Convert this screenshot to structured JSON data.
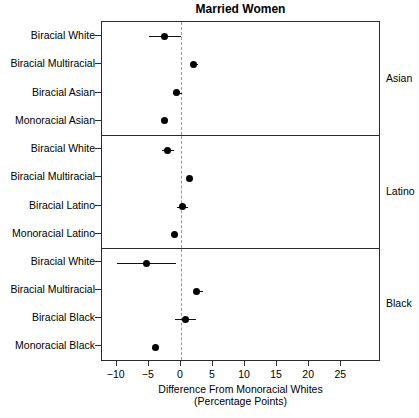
{
  "chart_data": {
    "type": "scatter",
    "title": "Married Women",
    "xlabel": "Difference From Monoracial Whites",
    "xlabel_line2": "(Percentage Points)",
    "ylabel": "",
    "xlim": [
      -12.3,
      31.2
    ],
    "xticks": [
      -10,
      -5,
      0,
      5,
      10,
      15,
      20,
      25
    ],
    "xtick_labels": [
      "−10",
      "−5",
      "0",
      "5",
      "10",
      "15",
      "20",
      "25"
    ],
    "grid": false,
    "legend": false,
    "reference_line": 0,
    "reference_line_style": "dashed",
    "panel_layout": "vertical-facets",
    "panel_strip_position": "right",
    "value_units": "percentage points",
    "panels": [
      {
        "name": "Asian",
        "categories": [
          "Biracial White",
          "Biracial Multiracial",
          "Biracial Asian",
          "Monoracial Asian"
        ],
        "values": [
          -2.6,
          1.9,
          -0.7,
          -2.6
        ],
        "ci_low": [
          -4.9,
          1.4,
          -1.3,
          -2.6
        ],
        "ci_high": [
          0.0,
          2.7,
          0.2,
          -2.6
        ]
      },
      {
        "name": "Latino",
        "categories": [
          "Biracial White",
          "Biracial Multiracial",
          "Biracial Latino",
          "Monoracial Latino"
        ],
        "values": [
          -2.1,
          1.3,
          0.2,
          -1.0
        ],
        "ci_low": [
          -3.0,
          1.0,
          -0.6,
          -1.0
        ],
        "ci_high": [
          -1.1,
          1.9,
          1.1,
          -1.0
        ]
      },
      {
        "name": "Black",
        "categories": [
          "Biracial White",
          "Biracial Multiracial",
          "Biracial Black",
          "Monoracial Black"
        ],
        "values": [
          -5.4,
          2.5,
          0.7,
          -4.0
        ],
        "ci_low": [
          -10.0,
          1.9,
          -0.9,
          -4.0
        ],
        "ci_high": [
          -0.8,
          3.5,
          2.4,
          -4.0
        ]
      }
    ],
    "colors": {
      "point": "#000000",
      "interval": "#111111",
      "frame": "#2b2b2b",
      "reference_line": "#9a9a9a",
      "background": "#ffffff"
    }
  }
}
